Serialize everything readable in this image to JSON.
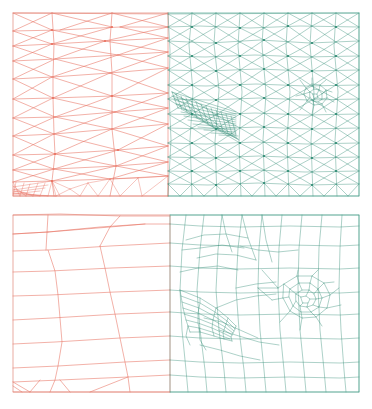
{
  "figure": {
    "background_color": "#ffffff",
    "width": 372,
    "height": 409,
    "panel_count": 2
  },
  "palette": {
    "partition_a_color": "#e8705f",
    "partition_b_color": "#2f8b74",
    "partition_a_name": "red-partition",
    "partition_b_name": "teal-partition",
    "background": "#ffffff"
  },
  "panels": [
    {
      "id": "panel-triangular",
      "label": "Triangular mesh",
      "element_type": "triangle",
      "frame": {
        "x": 13,
        "y": 13,
        "width": 346,
        "height": 183
      },
      "interface_x": 168,
      "regions": [
        {
          "name": "coarse-left-region",
          "color": "#e8705f",
          "description": "coarse anisotropic triangles, stretched horizontally",
          "x_range": [
            13,
            168
          ]
        },
        {
          "name": "refined-right-region",
          "color": "#2f8b74",
          "description": "fine triangles with boundary-layer fan and vortex refinement",
          "x_range": [
            168,
            359
          ]
        }
      ],
      "features": [
        "anisotropic fan cluster near x=200 y=110",
        "dense flat strip along bottom-left edge",
        "refinement cluster near x=318 y=95"
      ]
    },
    {
      "id": "panel-quad",
      "label": "Quadrilateral mesh",
      "element_type": "quadrilateral",
      "frame": {
        "x": 13,
        "y": 215,
        "width": 346,
        "height": 177
      },
      "interface_x": 170,
      "regions": [
        {
          "name": "coarse-left-region",
          "color": "#e8705f",
          "description": "coarse horizontal quad bands",
          "x_range": [
            13,
            170
          ]
        },
        {
          "name": "refined-right-region",
          "color": "#2f8b74",
          "description": "refined quads with radial vortex pattern",
          "x_range": [
            170,
            359
          ]
        }
      ],
      "features": [
        "radial vortex refinement near x=300 y=305",
        "recirculation block near x=215 y=300",
        "column bands along right edge"
      ]
    }
  ]
}
